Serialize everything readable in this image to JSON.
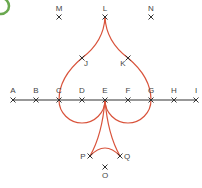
{
  "badge": {
    "color": "#6aa84f"
  },
  "colors": {
    "curve": "#d9533b",
    "line": "#333333",
    "label": "#444444"
  },
  "line": {
    "y": 100,
    "x1": 13,
    "x2": 196
  },
  "points": [
    {
      "label": "A",
      "x": 13,
      "y": 100,
      "lx": 13,
      "ly": 93
    },
    {
      "label": "B",
      "x": 36,
      "y": 100,
      "lx": 36,
      "ly": 93
    },
    {
      "label": "C",
      "x": 59,
      "y": 100,
      "lx": 59,
      "ly": 93
    },
    {
      "label": "D",
      "x": 82,
      "y": 100,
      "lx": 82,
      "ly": 93
    },
    {
      "label": "E",
      "x": 105,
      "y": 100,
      "lx": 105,
      "ly": 93
    },
    {
      "label": "F",
      "x": 128,
      "y": 100,
      "lx": 128,
      "ly": 93
    },
    {
      "label": "G",
      "x": 151,
      "y": 100,
      "lx": 151,
      "ly": 93
    },
    {
      "label": "H",
      "x": 174,
      "y": 100,
      "lx": 174,
      "ly": 93
    },
    {
      "label": "I",
      "x": 196,
      "y": 100,
      "lx": 196,
      "ly": 93
    },
    {
      "label": "L",
      "x": 105,
      "y": 17,
      "lx": 105,
      "ly": 11
    },
    {
      "label": "M",
      "x": 59,
      "y": 17,
      "lx": 59,
      "ly": 11
    },
    {
      "label": "N",
      "x": 151,
      "y": 17,
      "lx": 151,
      "ly": 11
    },
    {
      "label": "J",
      "x": 82,
      "y": 58,
      "lx": 86,
      "ly": 66
    },
    {
      "label": "K",
      "x": 128,
      "y": 58,
      "lx": 123,
      "ly": 66
    },
    {
      "label": "P",
      "x": 90,
      "y": 156,
      "lx": 83,
      "ly": 159
    },
    {
      "label": "Q",
      "x": 120,
      "y": 156,
      "lx": 127,
      "ly": 159
    },
    {
      "label": "O",
      "x": 105,
      "y": 167,
      "lx": 105,
      "ly": 178
    }
  ]
}
